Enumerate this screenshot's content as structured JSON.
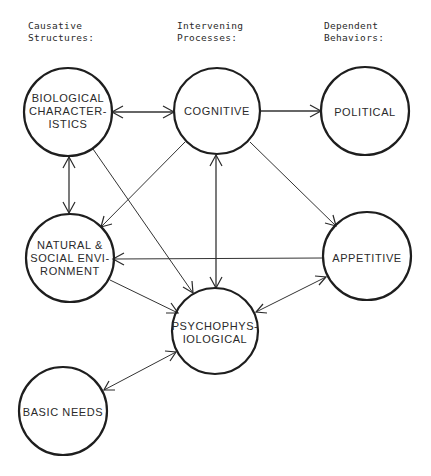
{
  "headers": {
    "causative": "Causative\nStructures:",
    "intervening": "Intervening\nProcesses:",
    "dependent": "Dependent\nBehaviors:"
  },
  "nodes": {
    "biological": {
      "lines": [
        "BIOLOGICAL",
        "CHARACTER-",
        "ISTICS"
      ]
    },
    "cognitive": {
      "lines": [
        "COGNITIVE"
      ]
    },
    "political": {
      "lines": [
        "POLITICAL"
      ]
    },
    "natural": {
      "lines": [
        "NATURAL &",
        "SOCIAL ENVI-",
        "RONMENT"
      ]
    },
    "appetitive": {
      "lines": [
        "APPETITIVE"
      ]
    },
    "psychophysiological": {
      "lines": [
        "PSYCHOPHYS-",
        "IOLOGICAL"
      ]
    },
    "basic_needs": {
      "lines": [
        "BASIC NEEDS"
      ]
    }
  },
  "edges": [
    {
      "from": "Biological Characteristics",
      "to": "Cognitive",
      "type": "bidirectional"
    },
    {
      "from": "Cognitive",
      "to": "Political",
      "type": "directed"
    },
    {
      "from": "Biological Characteristics",
      "to": "Natural & Social Environment",
      "type": "bidirectional"
    },
    {
      "from": "Biological Characteristics",
      "to": "Psychophysiological",
      "type": "directed"
    },
    {
      "from": "Cognitive",
      "to": "Natural & Social Environment",
      "type": "directed"
    },
    {
      "from": "Cognitive",
      "to": "Psychophysiological",
      "type": "bidirectional"
    },
    {
      "from": "Cognitive",
      "to": "Appetitive",
      "type": "directed"
    },
    {
      "from": "Appetitive",
      "to": "Natural & Social Environment",
      "type": "directed"
    },
    {
      "from": "Natural & Social Environment",
      "to": "Psychophysiological",
      "type": "directed"
    },
    {
      "from": "Psychophysiological",
      "to": "Appetitive",
      "type": "bidirectional"
    },
    {
      "from": "Psychophysiological",
      "to": "Basic Needs",
      "type": "bidirectional"
    }
  ]
}
